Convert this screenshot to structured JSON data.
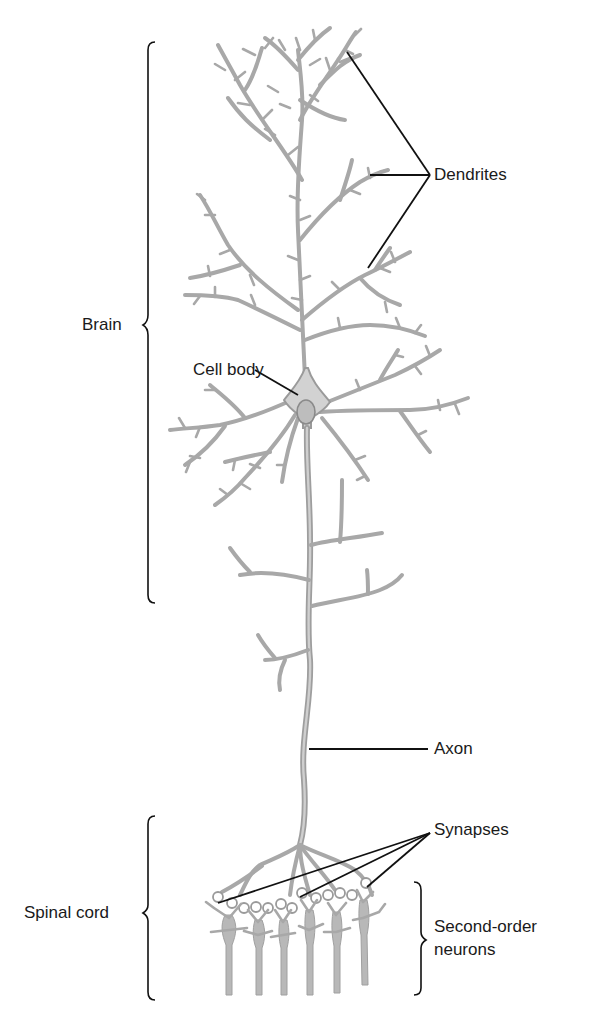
{
  "colors": {
    "neuron_fill": "#b4b4b4",
    "neuron_stroke": "#9a9a9a",
    "soma_fill": "#d2d2d2",
    "nucleus_fill": "#bdbdbd",
    "leader_line": "#111111",
    "text": "#1a1a1a",
    "background": "#ffffff"
  },
  "labels": {
    "dendrites": "Dendrites",
    "cell_body": "Cell body",
    "axon": "Axon",
    "synapses": "Synapses",
    "second_order_line1": "Second-order",
    "second_order_line2": "neurons",
    "brain": "Brain",
    "spinal_cord": "Spinal cord"
  },
  "regions": [
    {
      "name": "Brain",
      "span_px": [
        42,
        603
      ]
    },
    {
      "name": "Spinal cord",
      "span_px": [
        817,
        1000
      ]
    },
    {
      "name": "Second-order neurons",
      "span_px": [
        882,
        995
      ]
    }
  ]
}
